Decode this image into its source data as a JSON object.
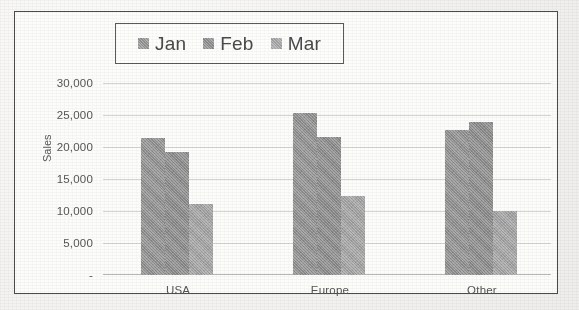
{
  "chart_data": {
    "type": "bar",
    "title": "",
    "subtitle": "",
    "xlabel": "",
    "ylabel": "Sales",
    "categories": [
      "USA",
      "Europe",
      "Other"
    ],
    "series": [
      {
        "name": "Jan",
        "values": [
          21400,
          25300,
          22700
        ],
        "color": "#8f8f8f"
      },
      {
        "name": "Feb",
        "values": [
          19200,
          21500,
          23900
        ],
        "color": "#8a8a8a"
      },
      {
        "name": "Mar",
        "values": [
          11100,
          12400,
          10000
        ],
        "color": "#a2a2a2"
      }
    ],
    "grouped_values": {
      "USA": {
        "Jan": 21400,
        "Feb": 25300,
        "Mar": 22700
      },
      "Europe": {
        "Jan": 19200,
        "Feb": 21500,
        "Mar": 23900
      },
      "Other": {
        "Jan": 11100,
        "Feb": 12400,
        "Mar": 10000
      }
    },
    "ylim": [
      0,
      30000
    ],
    "ytick_values": [
      0,
      5000,
      10000,
      15000,
      20000,
      25000,
      30000
    ],
    "ytick_labels": [
      "-",
      "5,000",
      "10,000",
      "15,000",
      "20,000",
      "25,000",
      "30,000"
    ],
    "grid": true,
    "grid_axis": "y",
    "legend_position": "top-center",
    "legend_entries": [
      "Jan",
      "Feb",
      "Mar"
    ],
    "orientation": "vertical",
    "bar_grouping": "clustered"
  },
  "legend": {
    "items": [
      {
        "label": "Jan",
        "swatch_name": "legend-swatch-jan",
        "color": "#8f8f8f"
      },
      {
        "label": "Feb",
        "swatch_name": "legend-swatch-feb",
        "color": "#8a8a8a"
      },
      {
        "label": "Mar",
        "swatch_name": "legend-swatch-mar",
        "color": "#a2a2a2"
      }
    ]
  },
  "axes": {
    "y_title": "Sales",
    "y_labels": [
      "30,000",
      "25,000",
      "20,000",
      "15,000",
      "10,000",
      "5,000",
      "-"
    ],
    "x_labels": [
      "USA",
      "Europe",
      "Other"
    ]
  },
  "style": {
    "frame_color": "#4b4b4b",
    "grid_color": "#d5d4d2",
    "text_color": "#555555",
    "plot_background": "#fcfcfb"
  }
}
